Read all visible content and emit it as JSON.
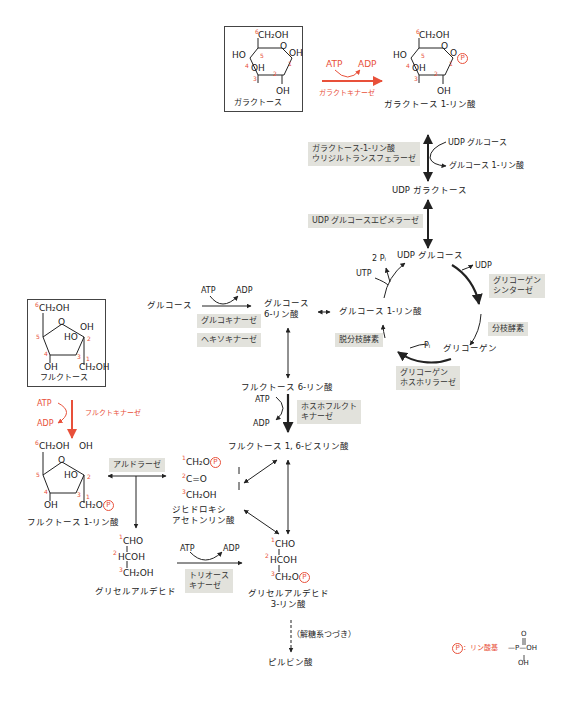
{
  "colors": {
    "accent": "#e8503a",
    "enzyme_bg": "#e2e2dc",
    "line": "#222222"
  },
  "galactose": {
    "label": "ガラクトース",
    "ring": {
      "c6": "CH₂OH",
      "ho4": "HO",
      "o_ring": "O",
      "oh1": "OH",
      "oh3": "OH",
      "oh2": "OH"
    },
    "numbers": [
      "6",
      "5",
      "4",
      "3",
      "2",
      "1"
    ]
  },
  "galactokinase": {
    "atp": "ATP",
    "adp": "ADP",
    "enzyme": "ガラクトキナーゼ"
  },
  "gal1p": {
    "label": "ガラクトース 1-リン酸",
    "ring": {
      "c6": "CH₂OH",
      "ho4": "HO",
      "o_ring": "O",
      "o1": "O",
      "p": "P",
      "oh3": "OH",
      "oh2": "OH"
    }
  },
  "uridyltransferase": {
    "enzyme_line1": "ガラクトース-1-リン酸",
    "enzyme_line2": "ウリジルトランスフェラーゼ",
    "in": "UDP グルコース",
    "out": "グルコース 1-リン酸"
  },
  "udp_galactose": "UDP ガラクトース",
  "epimerase": "UDP グルコースエピメラーゼ",
  "glycogen_cycle": {
    "udp_glucose": "UDP グルコース",
    "two_pi": "2 Pᵢ",
    "utp": "UTP",
    "udp": "UDP",
    "synthase_line1": "グリコーゲン",
    "synthase_line2": "シンターゼ",
    "branching": "分枝酵素",
    "glycogen": "グリコーゲン",
    "pi": "Pᵢ",
    "phosphorylase_line1": "グリコーゲン",
    "phosphorylase_line2": "ホスホリラーゼ",
    "debranching": "脱分枝酵素",
    "g1p": "グルコース 1-リン酸"
  },
  "glucose_phos": {
    "glucose": "グルコース",
    "atp": "ATP",
    "adp": "ADP",
    "enzyme1": "グルコキナーゼ",
    "enzyme2": "ヘキソキナーゼ",
    "g6p_line1": "グルコース",
    "g6p_line2": "6-リン酸"
  },
  "f6p": "フルクトース 6-リン酸",
  "pfk": {
    "atp": "ATP",
    "adp": "ADP",
    "enzyme_line1": "ホスホフルクト",
    "enzyme_line2": "キナーゼ"
  },
  "f16bp": "フルクトース 1, 6-ビスリン酸",
  "fructose": {
    "label": "フルクトース",
    "ring": {
      "c6": "CH₂OH",
      "o_ring": "O",
      "oh2": "OH",
      "ho3": "HO",
      "oh4": "OH",
      "c1": "CH₂OH"
    }
  },
  "fructokinase": {
    "atp": "ATP",
    "adp": "ADP",
    "enzyme": "フルクトキナーゼ"
  },
  "f1p": {
    "label": "フルクトース 1-リン酸",
    "ring": {
      "c6": "CH₂OH",
      "oh2": "OH",
      "o_ring": "O",
      "ho3": "HO",
      "oh4": "OH",
      "c1": "CH₂O"
    }
  },
  "aldolase": "アルドラーゼ",
  "dhap": {
    "c1": "CH₂O",
    "c2": "C=O",
    "c3": "CH₂OH",
    "label_line1": "ジヒドロキシ",
    "label_line2": "アセトンリン酸"
  },
  "glyceraldehyde": {
    "c1": "CHO",
    "c2": "HCOH",
    "c3": "CH₂OH",
    "label": "グリセルアルデヒド"
  },
  "triokinase": {
    "atp": "ATP",
    "adp": "ADP",
    "enzyme_line1": "トリオース",
    "enzyme_line2": "キナーゼ"
  },
  "gap": {
    "c1": "CHO",
    "c2": "HCOH",
    "c3": "CH₂O",
    "label_line1": "グリセルアルデヒド",
    "label_line2": "3-リン酸"
  },
  "glycolysis_note": "（解糖系つづき）",
  "pyruvate": "ピルビン酸",
  "legend": {
    "p_symbol": "P",
    "label": "：リン酸基",
    "formula_o": "O",
    "formula_p": "—P—OH",
    "formula_oh": "OH"
  }
}
